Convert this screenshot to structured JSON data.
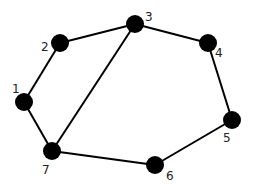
{
  "graph": {
    "nodes": [
      {
        "id": "1",
        "label": "1",
        "x": 24,
        "y": 102,
        "lx": 12,
        "ly": 93
      },
      {
        "id": "2",
        "label": "2",
        "x": 60,
        "y": 43,
        "lx": 41,
        "ly": 51
      },
      {
        "id": "3",
        "label": "3",
        "x": 135,
        "y": 24,
        "lx": 145,
        "ly": 21
      },
      {
        "id": "4",
        "label": "4",
        "x": 208,
        "y": 43,
        "lx": 215,
        "ly": 57
      },
      {
        "id": "5",
        "label": "5",
        "x": 232,
        "y": 120,
        "lx": 223,
        "ly": 142
      },
      {
        "id": "6",
        "label": "6",
        "x": 155,
        "y": 165,
        "lx": 166,
        "ly": 180
      },
      {
        "id": "7",
        "label": "7",
        "x": 52,
        "y": 151,
        "lx": 42,
        "ly": 174
      }
    ],
    "edges": [
      [
        "1",
        "2"
      ],
      [
        "2",
        "3"
      ],
      [
        "3",
        "4"
      ],
      [
        "4",
        "5"
      ],
      [
        "5",
        "6"
      ],
      [
        "6",
        "7"
      ],
      [
        "7",
        "1"
      ],
      [
        "3",
        "7"
      ]
    ],
    "node_radius": 9,
    "colors": {
      "node": "#000000",
      "edge": "#000000",
      "label": "#222222",
      "background": "#ffffff"
    }
  }
}
